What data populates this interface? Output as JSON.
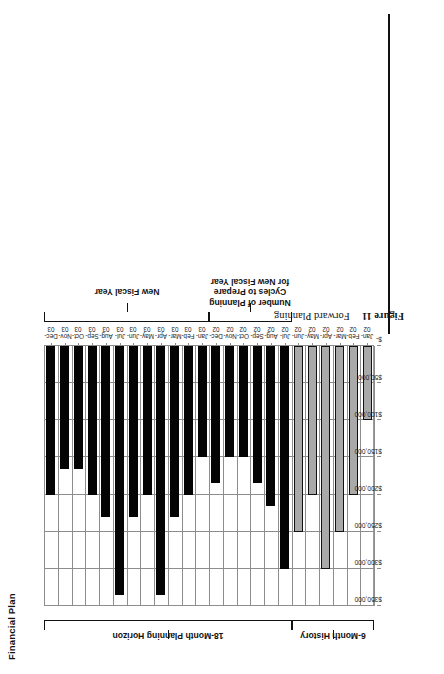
{
  "figure": {
    "caption_number": "Figure 11",
    "caption_text": "Forward Planning"
  },
  "chart_title": "Financial Plan",
  "brackets": [
    {
      "name": "planning-horizon",
      "label": "18-Month Planning Horizon"
    },
    {
      "name": "new-fiscal-year",
      "label": "New Fiscal Year"
    },
    {
      "name": "planning-cycles",
      "label": "Number of Planning\nCycles to Prepare\nfor New Fiscal Year"
    },
    {
      "name": "six-month-history",
      "label": "6-Month History"
    }
  ],
  "chart_data": {
    "type": "bar",
    "title": "Financial Plan",
    "xlabel": "",
    "ylabel": "",
    "orientation": "horizontal",
    "grid": true,
    "legend": "none",
    "ylim": [
      0,
      350000
    ],
    "tick_labels": [
      "$350,000",
      "$300,000",
      "$250,000",
      "$200,000",
      "$150,000",
      "$100,000",
      "$50,000",
      "$-"
    ],
    "tick_values": [
      350000,
      300000,
      250000,
      200000,
      150000,
      100000,
      50000,
      0
    ],
    "series": [
      {
        "name": "6-Month History",
        "color": "#a9a9a9"
      },
      {
        "name": "Plan",
        "color": "#040404"
      }
    ],
    "categories": [
      "Dec-\n03",
      "Nov-\n03",
      "Oct-\n03",
      "Sep-\n03",
      "Aug-\n03",
      "Jul-\n03",
      "Jun-\n03",
      "May-\n03",
      "Apr-\n03",
      "Mar-\n03",
      "Feb-\n03",
      "Jan-\n03",
      "Dec-\n02",
      "Nov-\n02",
      "Oct-\n02",
      "Sep-\n02",
      "Aug-\n02",
      "Jul-\n02",
      "Jun-\n02",
      "May-\n02",
      "Apr-\n02",
      "Mar-\n02",
      "Feb-\n02",
      "Jan-\n02"
    ],
    "values": [
      200000,
      165000,
      165000,
      200000,
      230000,
      335000,
      230000,
      200000,
      335000,
      230000,
      200000,
      150000,
      185000,
      150000,
      150000,
      185000,
      215000,
      300000,
      250000,
      200000,
      300000,
      250000,
      200000,
      100000
    ],
    "bar_types": [
      "plan",
      "plan",
      "plan",
      "plan",
      "plan",
      "plan",
      "plan",
      "plan",
      "plan",
      "plan",
      "plan",
      "plan",
      "plan",
      "plan",
      "plan",
      "plan",
      "plan",
      "plan",
      "hist",
      "hist",
      "hist",
      "hist",
      "hist",
      "hist"
    ]
  }
}
